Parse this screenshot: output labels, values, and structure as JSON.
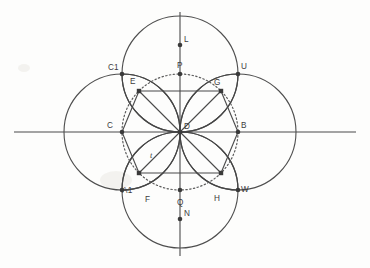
{
  "figure": {
    "background_color": "#fdfdfc",
    "stroke_color": "#4a4a4a",
    "center": {
      "x": 180,
      "y": 132,
      "label": "D"
    },
    "radius": 58,
    "axes": {
      "horizontal": {
        "y": 132,
        "x1": 14,
        "x2": 356
      },
      "vertical": {
        "x": 180,
        "y1": 12,
        "y2": 256
      }
    },
    "circles": [
      {
        "name": "top-circle",
        "cx": 180,
        "cy": 74,
        "r": 58
      },
      {
        "name": "right-circle",
        "cx": 238,
        "cy": 132,
        "r": 58
      },
      {
        "name": "bottom-circle",
        "cx": 180,
        "cy": 190,
        "r": 58
      },
      {
        "name": "left-circle",
        "cx": 122,
        "cy": 132,
        "r": 58
      }
    ],
    "inner_dotted_circle": {
      "cx": 180,
      "cy": 132,
      "r": 58
    },
    "points": [
      {
        "id": "L",
        "x": 180,
        "y": 45,
        "label": "L",
        "lx": 184,
        "ly": 42,
        "marker": "dot"
      },
      {
        "id": "C1",
        "x": 122,
        "y": 74,
        "label": "C1",
        "lx": 108,
        "ly": 70,
        "marker": "dot"
      },
      {
        "id": "P",
        "x": 180,
        "y": 74,
        "label": "P",
        "lx": 177,
        "ly": 68,
        "marker": "dot"
      },
      {
        "id": "U",
        "x": 238,
        "y": 74,
        "label": "U",
        "lx": 241,
        "ly": 69,
        "marker": "dot"
      },
      {
        "id": "E",
        "x": 139,
        "y": 91,
        "label": "E",
        "lx": 130,
        "ly": 84,
        "marker": "square"
      },
      {
        "id": "G",
        "x": 221,
        "y": 91,
        "label": "G",
        "lx": 214,
        "ly": 85,
        "marker": "square"
      },
      {
        "id": "C",
        "x": 122,
        "y": 132,
        "label": "C",
        "lx": 107,
        "ly": 128,
        "marker": "dot"
      },
      {
        "id": "D",
        "x": 180,
        "y": 132,
        "label": "D",
        "lx": 184,
        "ly": 129,
        "marker": "dot"
      },
      {
        "id": "B",
        "x": 238,
        "y": 132,
        "label": "B",
        "lx": 241,
        "ly": 128,
        "marker": "dot"
      },
      {
        "id": "t",
        "x": 152,
        "y": 155,
        "label": "t",
        "lx": 150,
        "ly": 158,
        "marker": "none"
      },
      {
        "id": "F",
        "x": 139,
        "y": 173,
        "label": "F",
        "lx": 145,
        "ly": 202,
        "marker": "square"
      },
      {
        "id": "H",
        "x": 221,
        "y": 173,
        "label": "H",
        "lx": 214,
        "ly": 201,
        "marker": "square"
      },
      {
        "id": "A1",
        "x": 122,
        "y": 190,
        "label": "A1",
        "lx": 122,
        "ly": 193,
        "marker": "dot"
      },
      {
        "id": "Q",
        "x": 180,
        "y": 190,
        "label": "Q",
        "lx": 177,
        "ly": 205,
        "marker": "dot"
      },
      {
        "id": "W",
        "x": 238,
        "y": 190,
        "label": "W",
        "lx": 241,
        "ly": 192,
        "marker": "dot"
      },
      {
        "id": "N",
        "x": 180,
        "y": 219,
        "label": "N",
        "lx": 184,
        "ly": 216,
        "marker": "dot"
      }
    ],
    "chords": [
      {
        "from": "E",
        "to": "G"
      },
      {
        "from": "F",
        "to": "H"
      },
      {
        "from": "E",
        "to": "C"
      },
      {
        "from": "C",
        "to": "F"
      },
      {
        "from": "G",
        "to": "B"
      },
      {
        "from": "B",
        "to": "H"
      },
      {
        "from": "E",
        "to": "D"
      },
      {
        "from": "G",
        "to": "D"
      },
      {
        "from": "F",
        "to": "D"
      },
      {
        "from": "H",
        "to": "D"
      }
    ],
    "petals": [
      {
        "name": "petal-top-left",
        "d": "M 180 132 A 58 58 0 0 1 122 74 A 58 58 0 0 1 180 132"
      },
      {
        "name": "petal-top-right",
        "d": "M 180 132 A 58 58 0 0 0 238 74 A 58 58 0 0 0 180 132"
      },
      {
        "name": "petal-bottom-right",
        "d": "M 180 132 A 58 58 0 0 1 238 190 A 58 58 0 0 1 180 132"
      },
      {
        "name": "petal-bottom-left",
        "d": "M 180 132 A 58 58 0 0 0 122 190 A 58 58 0 0 0 180 132"
      }
    ]
  }
}
